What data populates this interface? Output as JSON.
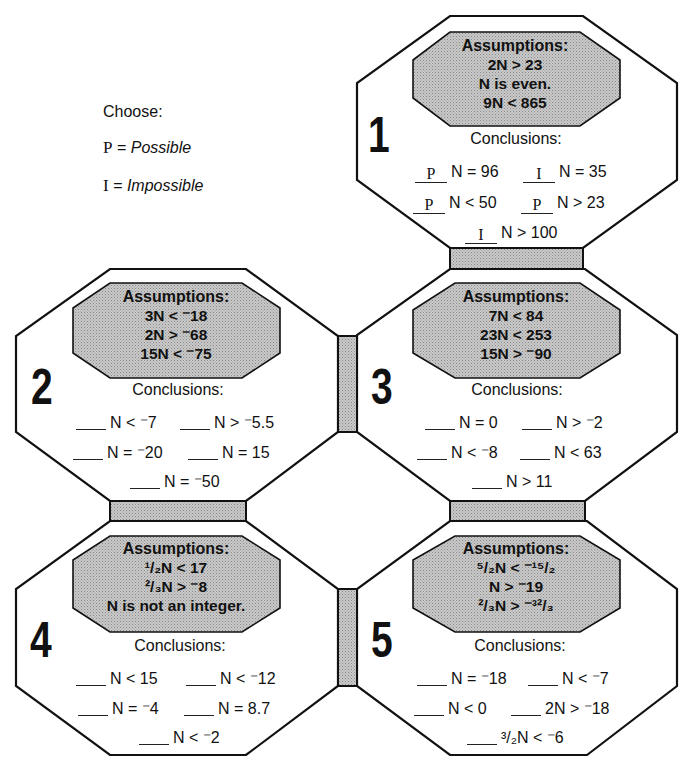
{
  "legend": {
    "heading": "Choose:",
    "options": [
      {
        "letter": "P",
        "equals": "=",
        "meaning": "Possible"
      },
      {
        "letter": "I",
        "equals": "=",
        "meaning": "Impossible"
      }
    ]
  },
  "colors": {
    "outline": "#111111",
    "assumption_fill": "#bdbdbd",
    "connector_fill": "#b5b5b5",
    "background": "#ffffff"
  },
  "puzzles": [
    {
      "number": "1",
      "assumptions_title": "Assumptions:",
      "assumptions": [
        "2N > 23",
        "N is even.",
        "9N < 865"
      ],
      "conclusions_title": "Conclusions:",
      "conclusions": [
        {
          "answer": "P",
          "statement": "N = 96"
        },
        {
          "answer": "I",
          "statement": "N = 35"
        },
        {
          "answer": "P",
          "statement": "N < 50"
        },
        {
          "answer": "P",
          "statement": "N > 23"
        },
        {
          "answer": "I",
          "statement": "N > 100"
        }
      ]
    },
    {
      "number": "2",
      "assumptions_title": "Assumptions:",
      "assumptions": [
        "3N < ⁻18",
        "2N > ⁻68",
        "15N < ⁻75"
      ],
      "conclusions_title": "Conclusions:",
      "conclusions": [
        {
          "answer": "",
          "statement": "N < ⁻7"
        },
        {
          "answer": "",
          "statement": "N > ⁻5.5"
        },
        {
          "answer": "",
          "statement": "N = ⁻20"
        },
        {
          "answer": "",
          "statement": "N = 15"
        },
        {
          "answer": "",
          "statement": "N = ⁻50"
        }
      ]
    },
    {
      "number": "3",
      "assumptions_title": "Assumptions:",
      "assumptions": [
        "7N < 84",
        "23N < 253",
        "15N > ⁻90"
      ],
      "conclusions_title": "Conclusions:",
      "conclusions": [
        {
          "answer": "",
          "statement": "N = 0"
        },
        {
          "answer": "",
          "statement": "N > ⁻2"
        },
        {
          "answer": "",
          "statement": "N < ⁻8"
        },
        {
          "answer": "",
          "statement": "N < 63"
        },
        {
          "answer": "",
          "statement": "N > 11"
        }
      ]
    },
    {
      "number": "4",
      "assumptions_title": "Assumptions:",
      "assumptions": [
        "¹/₂N < 17",
        "²/₃N > ⁻8",
        "N is not an integer."
      ],
      "conclusions_title": "Conclusions:",
      "conclusions": [
        {
          "answer": "",
          "statement": "N < 15"
        },
        {
          "answer": "",
          "statement": "N < ⁻12"
        },
        {
          "answer": "",
          "statement": "N = ⁻4"
        },
        {
          "answer": "",
          "statement": "N = 8.7"
        },
        {
          "answer": "",
          "statement": "N < ⁻2"
        }
      ]
    },
    {
      "number": "5",
      "assumptions_title": "Assumptions:",
      "assumptions": [
        "⁵/₂N < ⁻¹⁵/₂",
        "N > ⁻19",
        "²/₃N > ⁻³²/₃"
      ],
      "conclusions_title": "Conclusions:",
      "conclusions": [
        {
          "answer": "",
          "statement": "N = ⁻18"
        },
        {
          "answer": "",
          "statement": "N < ⁻7"
        },
        {
          "answer": "",
          "statement": "N < 0"
        },
        {
          "answer": "",
          "statement": "2N > ⁻18"
        },
        {
          "answer": "",
          "statement": "³/₂N < ⁻6"
        }
      ]
    }
  ]
}
